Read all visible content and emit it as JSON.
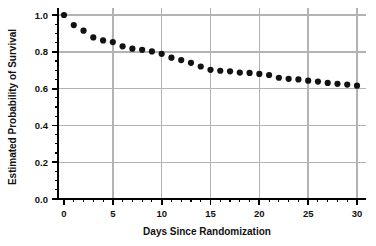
{
  "chart_data": {
    "type": "scatter",
    "title": "",
    "xlabel": "Days Since Randomization",
    "ylabel": "Estimated Probability of Survival",
    "xlim": [
      0,
      30
    ],
    "ylim": [
      0.0,
      1.0
    ],
    "grid": true,
    "legend": null,
    "marker": "filled-circle",
    "marker_color": "#121212",
    "grid_color": "#b3b3b3",
    "axis_color": "#000000",
    "background": "#ffffff",
    "x_ticks": [
      0,
      5,
      10,
      15,
      20,
      25,
      30
    ],
    "x_tick_labels": [
      "0",
      "5",
      "10",
      "15",
      "20",
      "25",
      "30"
    ],
    "x_minor_tick_step": 1,
    "y_ticks": [
      0.0,
      0.2,
      0.4,
      0.6,
      0.8,
      1.0
    ],
    "y_tick_labels": [
      "0.0",
      "0.2",
      "0.4",
      "0.6",
      "0.8",
      "1.0"
    ],
    "y_minor_tick_step": 0.05,
    "x": [
      0,
      1,
      2,
      3,
      4,
      5,
      6,
      7,
      8,
      9,
      10,
      11,
      12,
      13,
      14,
      15,
      16,
      17,
      18,
      19,
      20,
      21,
      22,
      23,
      24,
      25,
      26,
      27,
      28,
      29,
      30
    ],
    "values": [
      1.0,
      0.945,
      0.915,
      0.878,
      0.862,
      0.853,
      0.83,
      0.817,
      0.811,
      0.802,
      0.789,
      0.768,
      0.755,
      0.74,
      0.72,
      0.702,
      0.697,
      0.694,
      0.687,
      0.685,
      0.68,
      0.674,
      0.659,
      0.653,
      0.65,
      0.643,
      0.638,
      0.631,
      0.626,
      0.622,
      0.616
    ],
    "series": [
      {
        "name": "Estimated Probability of Survival",
        "x": [
          0,
          1,
          2,
          3,
          4,
          5,
          6,
          7,
          8,
          9,
          10,
          11,
          12,
          13,
          14,
          15,
          16,
          17,
          18,
          19,
          20,
          21,
          22,
          23,
          24,
          25,
          26,
          27,
          28,
          29,
          30
        ],
        "values": [
          1.0,
          0.945,
          0.915,
          0.878,
          0.862,
          0.853,
          0.83,
          0.817,
          0.811,
          0.802,
          0.789,
          0.768,
          0.755,
          0.74,
          0.72,
          0.702,
          0.697,
          0.694,
          0.687,
          0.685,
          0.68,
          0.674,
          0.659,
          0.653,
          0.65,
          0.643,
          0.638,
          0.631,
          0.626,
          0.622,
          0.616
        ]
      }
    ]
  }
}
